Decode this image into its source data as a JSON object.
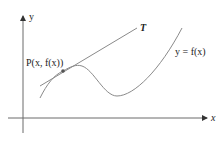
{
  "figure": {
    "axes": {
      "x_label": "x",
      "y_label": "y"
    },
    "labels": {
      "point": "P(x, f(x))",
      "tangent": "T",
      "curve": "y = f(x)"
    },
    "colors": {
      "curve": "#8a8a8a",
      "axes": "#6a6a6a",
      "text": "#222222",
      "point": "#555555"
    }
  }
}
